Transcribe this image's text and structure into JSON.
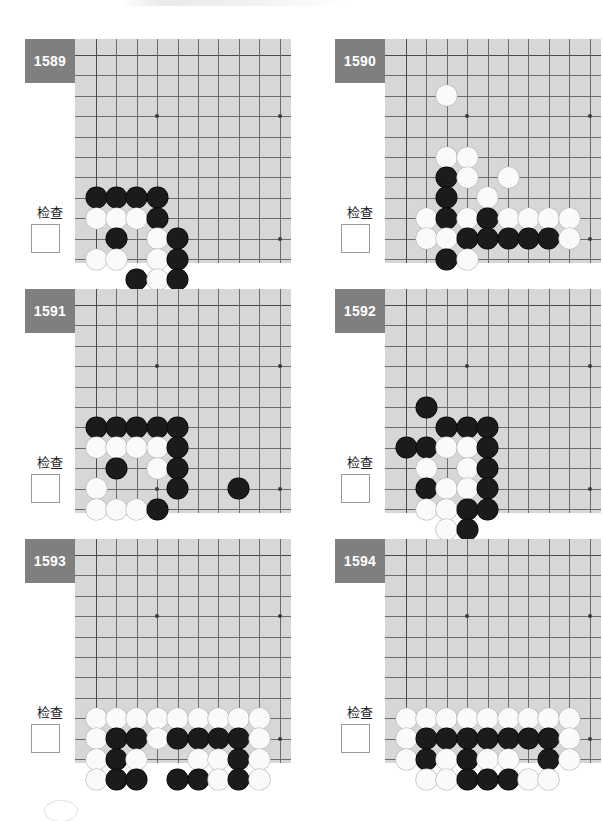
{
  "page": {
    "background_color": "#ffffff",
    "board_color": "#d7d7d7",
    "badge_color": "#7f7f7f",
    "line_color": "#6b6b6b",
    "black_stone_color": "#1b1b1b",
    "white_stone_color": "#fafafa"
  },
  "board_geometry": {
    "cols": 10,
    "rows": 10,
    "cell_px": 20.4,
    "origin_x": 21,
    "origin_y": 16,
    "star_points": [
      [
        3,
        3
      ],
      [
        9,
        3
      ],
      [
        3,
        9
      ],
      [
        9,
        9
      ]
    ]
  },
  "common": {
    "check_label": "检查",
    "checkbox_value": ""
  },
  "puzzles": [
    {
      "number": "1589",
      "check_label": "检查",
      "stones": [
        {
          "c": 0,
          "r": 7,
          "color": "b"
        },
        {
          "c": 1,
          "r": 7,
          "color": "b"
        },
        {
          "c": 2,
          "r": 7,
          "color": "b"
        },
        {
          "c": 3,
          "r": 7,
          "color": "b"
        },
        {
          "c": 0,
          "r": 8,
          "color": "w"
        },
        {
          "c": 1,
          "r": 8,
          "color": "w"
        },
        {
          "c": 2,
          "r": 8,
          "color": "w"
        },
        {
          "c": 3,
          "r": 8,
          "color": "b"
        },
        {
          "c": 1,
          "r": 9,
          "color": "b"
        },
        {
          "c": 3,
          "r": 9,
          "color": "w"
        },
        {
          "c": 4,
          "r": 9,
          "color": "b"
        },
        {
          "c": 0,
          "r": 10,
          "color": "w"
        },
        {
          "c": 1,
          "r": 10,
          "color": "w"
        },
        {
          "c": 3,
          "r": 10,
          "color": "w"
        },
        {
          "c": 4,
          "r": 10,
          "color": "b"
        },
        {
          "c": 2,
          "r": 11,
          "color": "b"
        },
        {
          "c": 3,
          "r": 11,
          "color": "w"
        },
        {
          "c": 4,
          "r": 11,
          "color": "b"
        }
      ]
    },
    {
      "number": "1590",
      "check_label": "检查",
      "stones": [
        {
          "c": 2,
          "r": 2,
          "color": "w"
        },
        {
          "c": 2,
          "r": 5,
          "color": "w"
        },
        {
          "c": 3,
          "r": 5,
          "color": "w"
        },
        {
          "c": 2,
          "r": 6,
          "color": "b"
        },
        {
          "c": 3,
          "r": 6,
          "color": "w"
        },
        {
          "c": 5,
          "r": 6,
          "color": "w"
        },
        {
          "c": 2,
          "r": 7,
          "color": "b"
        },
        {
          "c": 4,
          "r": 7,
          "color": "w"
        },
        {
          "c": 1,
          "r": 8,
          "color": "w"
        },
        {
          "c": 2,
          "r": 8,
          "color": "b"
        },
        {
          "c": 3,
          "r": 8,
          "color": "w"
        },
        {
          "c": 4,
          "r": 8,
          "color": "b"
        },
        {
          "c": 5,
          "r": 8,
          "color": "w"
        },
        {
          "c": 6,
          "r": 8,
          "color": "w"
        },
        {
          "c": 7,
          "r": 8,
          "color": "w"
        },
        {
          "c": 8,
          "r": 8,
          "color": "w"
        },
        {
          "c": 1,
          "r": 9,
          "color": "w"
        },
        {
          "c": 2,
          "r": 9,
          "color": "w"
        },
        {
          "c": 3,
          "r": 9,
          "color": "b"
        },
        {
          "c": 4,
          "r": 9,
          "color": "b"
        },
        {
          "c": 5,
          "r": 9,
          "color": "b"
        },
        {
          "c": 6,
          "r": 9,
          "color": "b"
        },
        {
          "c": 7,
          "r": 9,
          "color": "b"
        },
        {
          "c": 8,
          "r": 9,
          "color": "w"
        },
        {
          "c": 2,
          "r": 10,
          "color": "b"
        },
        {
          "c": 3,
          "r": 10,
          "color": "w"
        }
      ]
    },
    {
      "number": "1591",
      "check_label": "检查",
      "stones": [
        {
          "c": 0,
          "r": 6,
          "color": "b"
        },
        {
          "c": 1,
          "r": 6,
          "color": "b"
        },
        {
          "c": 2,
          "r": 6,
          "color": "b"
        },
        {
          "c": 3,
          "r": 6,
          "color": "b"
        },
        {
          "c": 4,
          "r": 6,
          "color": "b"
        },
        {
          "c": 0,
          "r": 7,
          "color": "w"
        },
        {
          "c": 1,
          "r": 7,
          "color": "w"
        },
        {
          "c": 2,
          "r": 7,
          "color": "w"
        },
        {
          "c": 3,
          "r": 7,
          "color": "w"
        },
        {
          "c": 4,
          "r": 7,
          "color": "b"
        },
        {
          "c": 1,
          "r": 8,
          "color": "b"
        },
        {
          "c": 3,
          "r": 8,
          "color": "w"
        },
        {
          "c": 4,
          "r": 8,
          "color": "b"
        },
        {
          "c": 0,
          "r": 9,
          "color": "w"
        },
        {
          "c": 4,
          "r": 9,
          "color": "b"
        },
        {
          "c": 7,
          "r": 9,
          "color": "b"
        },
        {
          "c": 0,
          "r": 10,
          "color": "w"
        },
        {
          "c": 1,
          "r": 10,
          "color": "w"
        },
        {
          "c": 2,
          "r": 10,
          "color": "w"
        },
        {
          "c": 3,
          "r": 10,
          "color": "b"
        }
      ]
    },
    {
      "number": "1592",
      "check_label": "检查",
      "stones": [
        {
          "c": 1,
          "r": 5,
          "color": "b"
        },
        {
          "c": 2,
          "r": 6,
          "color": "b"
        },
        {
          "c": 3,
          "r": 6,
          "color": "b"
        },
        {
          "c": 4,
          "r": 6,
          "color": "b"
        },
        {
          "c": 0,
          "r": 7,
          "color": "b"
        },
        {
          "c": 1,
          "r": 7,
          "color": "b"
        },
        {
          "c": 2,
          "r": 7,
          "color": "w"
        },
        {
          "c": 3,
          "r": 7,
          "color": "w"
        },
        {
          "c": 4,
          "r": 7,
          "color": "b"
        },
        {
          "c": 1,
          "r": 8,
          "color": "w"
        },
        {
          "c": 3,
          "r": 8,
          "color": "w"
        },
        {
          "c": 4,
          "r": 8,
          "color": "b"
        },
        {
          "c": 1,
          "r": 9,
          "color": "b"
        },
        {
          "c": 2,
          "r": 9,
          "color": "w"
        },
        {
          "c": 3,
          "r": 9,
          "color": "w"
        },
        {
          "c": 4,
          "r": 9,
          "color": "b"
        },
        {
          "c": 1,
          "r": 10,
          "color": "w"
        },
        {
          "c": 2,
          "r": 10,
          "color": "w"
        },
        {
          "c": 3,
          "r": 10,
          "color": "b"
        },
        {
          "c": 4,
          "r": 10,
          "color": "b"
        },
        {
          "c": 2,
          "r": 11,
          "color": "w"
        },
        {
          "c": 3,
          "r": 11,
          "color": "b"
        }
      ]
    },
    {
      "number": "1593",
      "check_label": "检查",
      "stones": [
        {
          "c": 0,
          "r": 8,
          "color": "w"
        },
        {
          "c": 1,
          "r": 8,
          "color": "w"
        },
        {
          "c": 2,
          "r": 8,
          "color": "w"
        },
        {
          "c": 3,
          "r": 8,
          "color": "w"
        },
        {
          "c": 4,
          "r": 8,
          "color": "w"
        },
        {
          "c": 5,
          "r": 8,
          "color": "w"
        },
        {
          "c": 6,
          "r": 8,
          "color": "w"
        },
        {
          "c": 7,
          "r": 8,
          "color": "w"
        },
        {
          "c": 8,
          "r": 8,
          "color": "w"
        },
        {
          "c": 0,
          "r": 9,
          "color": "w"
        },
        {
          "c": 1,
          "r": 9,
          "color": "b"
        },
        {
          "c": 2,
          "r": 9,
          "color": "b"
        },
        {
          "c": 3,
          "r": 9,
          "color": "w"
        },
        {
          "c": 4,
          "r": 9,
          "color": "b"
        },
        {
          "c": 5,
          "r": 9,
          "color": "b"
        },
        {
          "c": 6,
          "r": 9,
          "color": "b"
        },
        {
          "c": 7,
          "r": 9,
          "color": "b"
        },
        {
          "c": 8,
          "r": 9,
          "color": "w"
        },
        {
          "c": 0,
          "r": 10,
          "color": "w"
        },
        {
          "c": 1,
          "r": 10,
          "color": "b"
        },
        {
          "c": 2,
          "r": 10,
          "color": "w"
        },
        {
          "c": 5,
          "r": 10,
          "color": "w"
        },
        {
          "c": 6,
          "r": 10,
          "color": "w"
        },
        {
          "c": 7,
          "r": 10,
          "color": "b"
        },
        {
          "c": 8,
          "r": 10,
          "color": "w"
        },
        {
          "c": 0,
          "r": 11,
          "color": "w"
        },
        {
          "c": 1,
          "r": 11,
          "color": "b"
        },
        {
          "c": 2,
          "r": 11,
          "color": "b"
        },
        {
          "c": 4,
          "r": 11,
          "color": "b"
        },
        {
          "c": 5,
          "r": 11,
          "color": "b"
        },
        {
          "c": 6,
          "r": 11,
          "color": "w"
        },
        {
          "c": 7,
          "r": 11,
          "color": "b"
        },
        {
          "c": 8,
          "r": 11,
          "color": "w"
        }
      ]
    },
    {
      "number": "1594",
      "check_label": "检查",
      "stones": [
        {
          "c": 0,
          "r": 8,
          "color": "w"
        },
        {
          "c": 1,
          "r": 8,
          "color": "w"
        },
        {
          "c": 2,
          "r": 8,
          "color": "w"
        },
        {
          "c": 3,
          "r": 8,
          "color": "w"
        },
        {
          "c": 4,
          "r": 8,
          "color": "w"
        },
        {
          "c": 5,
          "r": 8,
          "color": "w"
        },
        {
          "c": 6,
          "r": 8,
          "color": "w"
        },
        {
          "c": 7,
          "r": 8,
          "color": "w"
        },
        {
          "c": 8,
          "r": 8,
          "color": "w"
        },
        {
          "c": 0,
          "r": 9,
          "color": "w"
        },
        {
          "c": 1,
          "r": 9,
          "color": "b"
        },
        {
          "c": 2,
          "r": 9,
          "color": "b"
        },
        {
          "c": 3,
          "r": 9,
          "color": "b"
        },
        {
          "c": 4,
          "r": 9,
          "color": "b"
        },
        {
          "c": 5,
          "r": 9,
          "color": "b"
        },
        {
          "c": 6,
          "r": 9,
          "color": "b"
        },
        {
          "c": 7,
          "r": 9,
          "color": "b"
        },
        {
          "c": 8,
          "r": 9,
          "color": "w"
        },
        {
          "c": 0,
          "r": 10,
          "color": "w"
        },
        {
          "c": 1,
          "r": 10,
          "color": "b"
        },
        {
          "c": 2,
          "r": 10,
          "color": "w"
        },
        {
          "c": 3,
          "r": 10,
          "color": "b"
        },
        {
          "c": 4,
          "r": 10,
          "color": "w"
        },
        {
          "c": 5,
          "r": 10,
          "color": "w"
        },
        {
          "c": 7,
          "r": 10,
          "color": "b"
        },
        {
          "c": 8,
          "r": 10,
          "color": "w"
        },
        {
          "c": 1,
          "r": 11,
          "color": "w"
        },
        {
          "c": 2,
          "r": 11,
          "color": "w"
        },
        {
          "c": 3,
          "r": 11,
          "color": "b"
        },
        {
          "c": 4,
          "r": 11,
          "color": "b"
        },
        {
          "c": 5,
          "r": 11,
          "color": "b"
        },
        {
          "c": 6,
          "r": 11,
          "color": "w"
        },
        {
          "c": 7,
          "r": 11,
          "color": "w"
        }
      ]
    }
  ]
}
